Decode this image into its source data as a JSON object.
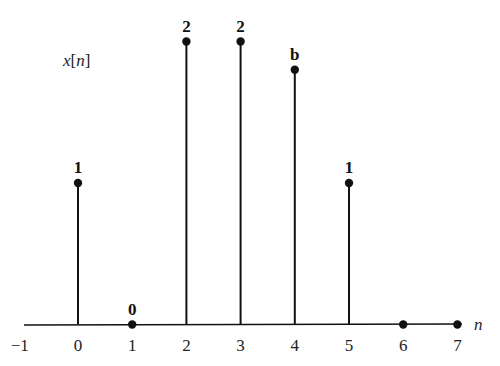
{
  "chart_data": {
    "type": "stem",
    "title": "",
    "ylabel": "x[n]",
    "xlabel": "n",
    "x": [
      0,
      1,
      2,
      3,
      4,
      5,
      6,
      7
    ],
    "values": [
      1,
      0,
      2,
      2,
      1.8,
      1,
      0,
      0
    ],
    "value_labels": [
      "1",
      "0",
      "2",
      "2",
      "b",
      "1",
      "",
      ""
    ],
    "xticks": [
      "-1",
      "0",
      "1",
      "2",
      "3",
      "4",
      "5",
      "6",
      "7"
    ],
    "xlim": [
      -1,
      7.5
    ],
    "ylim": [
      0,
      2.2
    ],
    "grid": false,
    "legend": null
  }
}
